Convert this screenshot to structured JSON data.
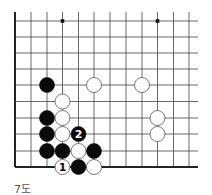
{
  "diagram": {
    "caption": "7도",
    "board": {
      "origin_x": 15,
      "origin_y": 21,
      "col_x": [
        15,
        31,
        47,
        62.5,
        78.5,
        94,
        110,
        126,
        142,
        157.5,
        173.5,
        189
      ],
      "row_y": [
        21,
        37,
        53,
        69,
        85,
        101.5,
        118,
        134,
        151,
        167
      ],
      "line_right": 198,
      "line_top": 12,
      "left_edge_thick": true,
      "bottom_edge_thick": true,
      "star_points": [
        {
          "col": 3,
          "row": 0
        },
        {
          "col": 9,
          "row": 0
        }
      ],
      "stone_radius": 7.5,
      "line_color": "#444444",
      "edge_color": "#222222"
    },
    "stones": [
      {
        "color": "black",
        "col": 2,
        "row": 4,
        "label": ""
      },
      {
        "color": "white",
        "col": 5,
        "row": 4,
        "label": ""
      },
      {
        "color": "white",
        "col": 8,
        "row": 4,
        "label": ""
      },
      {
        "color": "white",
        "col": 3,
        "row": 5,
        "label": ""
      },
      {
        "color": "black",
        "col": 2,
        "row": 6,
        "label": ""
      },
      {
        "color": "white",
        "col": 3,
        "row": 6,
        "label": ""
      },
      {
        "color": "white",
        "col": 9,
        "row": 6,
        "label": ""
      },
      {
        "color": "black",
        "col": 2,
        "row": 7,
        "label": ""
      },
      {
        "color": "white",
        "col": 3,
        "row": 7,
        "label": ""
      },
      {
        "color": "black",
        "col": 4,
        "row": 7,
        "label": "2"
      },
      {
        "color": "white",
        "col": 9,
        "row": 7,
        "label": ""
      },
      {
        "color": "black",
        "col": 2,
        "row": 8,
        "label": ""
      },
      {
        "color": "black",
        "col": 3,
        "row": 8,
        "label": ""
      },
      {
        "color": "white",
        "col": 4,
        "row": 8,
        "label": ""
      },
      {
        "color": "black",
        "col": 5,
        "row": 8,
        "label": ""
      },
      {
        "color": "white",
        "col": 3,
        "row": 9,
        "label": "1"
      },
      {
        "color": "black",
        "col": 4,
        "row": 9,
        "label": ""
      },
      {
        "color": "white",
        "col": 5,
        "row": 9,
        "label": ""
      }
    ]
  }
}
